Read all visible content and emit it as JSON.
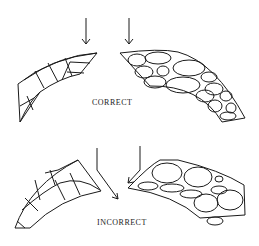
{
  "diagram": {
    "panels": [
      {
        "id": "correct",
        "label": "CORRECT",
        "left_shape": "cut-block-arch-segment",
        "right_shape": "rubble-stone-arch-segment",
        "arrows": "vertical, pointing down onto joint faces"
      },
      {
        "id": "incorrect",
        "label": "INCORRECT",
        "left_shape": "cut-block-arch-segment",
        "right_shape": "rubble-stone-arch-segment",
        "arrows": "angled, converging toward gap"
      }
    ],
    "colors": {
      "line": "#1a1a1a",
      "background": "#ffffff"
    }
  }
}
